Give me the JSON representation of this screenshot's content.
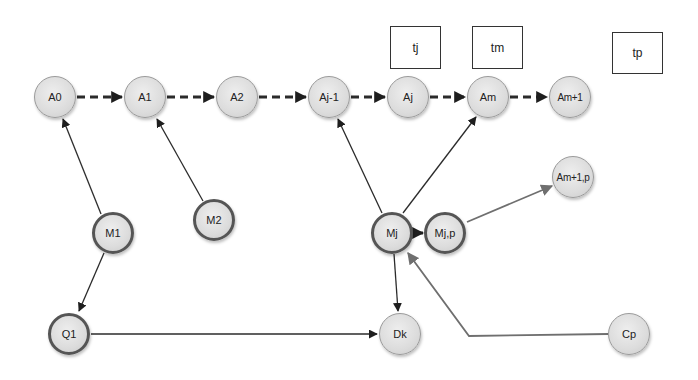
{
  "diagram": {
    "type": "directed-graph",
    "colors": {
      "node_fill": "#dcdcdc",
      "node_border": "#9a9a9a",
      "node_border_bold": "#555555",
      "edge_dark": "#2b2b2b",
      "edge_gray": "#6f6f6f"
    },
    "nodes": {
      "A0": "A0",
      "A1": "A1",
      "A2": "A2",
      "Aj_1": "Aj-1",
      "Aj": "Aj",
      "Am": "Am",
      "Am_1": "Am+1",
      "M1": "M1",
      "M2": "M2",
      "Mj": "Mj",
      "Mjp": "Mj,p",
      "Am_1p": "Am+1,p",
      "Q1": "Q1",
      "Dk": "Dk",
      "Cp": "Cp"
    },
    "boxes": {
      "tj": "tj",
      "tm": "tm",
      "tp": "tp"
    },
    "edges": [
      {
        "from": "A0",
        "to": "A1",
        "style": "dashed"
      },
      {
        "from": "A1",
        "to": "A2",
        "style": "dashed"
      },
      {
        "from": "A2",
        "to": "Aj-1",
        "style": "dashed"
      },
      {
        "from": "Aj-1",
        "to": "Aj",
        "style": "dashed"
      },
      {
        "from": "Aj",
        "to": "Am",
        "style": "dashed"
      },
      {
        "from": "Am",
        "to": "Am+1",
        "style": "dashed"
      },
      {
        "from": "M1",
        "to": "A0",
        "style": "solid"
      },
      {
        "from": "M2",
        "to": "A1",
        "style": "solid"
      },
      {
        "from": "M1",
        "to": "Q1",
        "style": "solid"
      },
      {
        "from": "Q1",
        "to": "Dk",
        "style": "solid"
      },
      {
        "from": "Mj",
        "to": "Aj-1",
        "style": "solid"
      },
      {
        "from": "Mj",
        "to": "Am",
        "style": "solid"
      },
      {
        "from": "Mj",
        "to": "Mj,p",
        "style": "solid"
      },
      {
        "from": "Mj",
        "to": "Dk",
        "style": "solid"
      },
      {
        "from": "Mj,p",
        "to": "Am+1,p",
        "style": "solid-gray"
      },
      {
        "from": "Cp",
        "to": "Mj",
        "style": "solid-gray"
      }
    ]
  }
}
